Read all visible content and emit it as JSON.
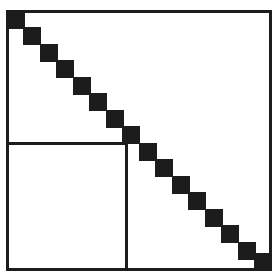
{
  "figure": {
    "kind": "matrix-sparsity-pattern",
    "width": 277,
    "height": 275,
    "background_color": "#ffffff",
    "ink_color": "#1c1c1c",
    "caption": "",
    "title": ""
  },
  "matrix_frame": {
    "label": "matrix-outline",
    "x": 6,
    "y": 10,
    "width": 266,
    "height": 261,
    "border_width": 3,
    "border_color": "#1c1c1c"
  },
  "partition_outline": {
    "label": "lower-left-partition",
    "x": 6,
    "y": 142,
    "width": 122,
    "height": 129,
    "border_width": 3,
    "border_color": "#1c1c1c"
  },
  "chart_data": {
    "type": "heatmap",
    "title": "",
    "xlabel": "",
    "ylabel": "",
    "grid": false,
    "legend": "none",
    "block_count": 16,
    "block_size": 18,
    "block_pitch": 16.5,
    "fill_color": "#1c1c1c",
    "blocks": [
      {
        "index": 1,
        "x": 7,
        "y": 11,
        "w": 18,
        "h": 18
      },
      {
        "index": 2,
        "x": 23,
        "y": 27,
        "w": 18,
        "h": 18
      },
      {
        "index": 3,
        "x": 40,
        "y": 44,
        "w": 18,
        "h": 18
      },
      {
        "index": 4,
        "x": 56,
        "y": 60,
        "w": 18,
        "h": 18
      },
      {
        "index": 5,
        "x": 73,
        "y": 77,
        "w": 18,
        "h": 18
      },
      {
        "index": 6,
        "x": 89,
        "y": 93,
        "w": 18,
        "h": 18
      },
      {
        "index": 7,
        "x": 106,
        "y": 110,
        "w": 18,
        "h": 18
      },
      {
        "index": 8,
        "x": 122,
        "y": 126,
        "w": 18,
        "h": 18
      },
      {
        "index": 9,
        "x": 139,
        "y": 143,
        "w": 18,
        "h": 18
      },
      {
        "index": 10,
        "x": 155,
        "y": 159,
        "w": 18,
        "h": 18
      },
      {
        "index": 11,
        "x": 172,
        "y": 176,
        "w": 18,
        "h": 18
      },
      {
        "index": 12,
        "x": 188,
        "y": 192,
        "w": 18,
        "h": 18
      },
      {
        "index": 13,
        "x": 205,
        "y": 209,
        "w": 18,
        "h": 18
      },
      {
        "index": 14,
        "x": 221,
        "y": 225,
        "w": 18,
        "h": 18
      },
      {
        "index": 15,
        "x": 238,
        "y": 242,
        "w": 18,
        "h": 18
      },
      {
        "index": 16,
        "x": 254,
        "y": 253,
        "w": 18,
        "h": 18
      }
    ]
  }
}
